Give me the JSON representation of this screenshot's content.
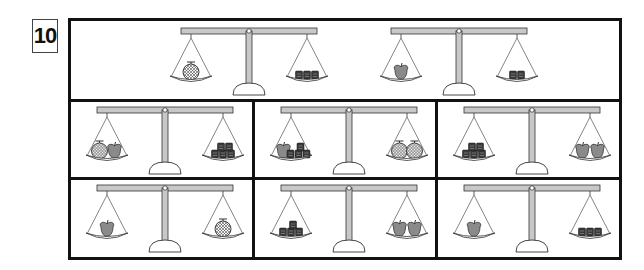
{
  "question_number": "10",
  "colors": {
    "beam": "#c8c8c8",
    "outline": "#333333",
    "apple": "#8a8a8a",
    "box": "#3a3a3a",
    "melon_fill": "#f4f4f4"
  },
  "top_row": {
    "scales": [
      {
        "left": [
          {
            "type": "melon",
            "count": 1
          }
        ],
        "right": [
          {
            "type": "box",
            "count": 3
          }
        ]
      },
      {
        "left": [
          {
            "type": "apple",
            "count": 1
          }
        ],
        "right": [
          {
            "type": "box",
            "count": 2
          }
        ]
      }
    ]
  },
  "options": [
    {
      "left": [
        {
          "type": "melon",
          "count": 1
        },
        {
          "type": "apple",
          "count": 1
        }
      ],
      "right": [
        {
          "type": "box",
          "count": 5
        }
      ]
    },
    {
      "left": [
        {
          "type": "apple",
          "count": 1
        },
        {
          "type": "box",
          "count": 4
        }
      ],
      "right": [
        {
          "type": "melon",
          "count": 2
        }
      ]
    },
    {
      "left": [
        {
          "type": "box",
          "count": 5
        }
      ],
      "right": [
        {
          "type": "apple",
          "count": 2
        }
      ]
    },
    {
      "left": [
        {
          "type": "apple",
          "count": 1
        }
      ],
      "right": [
        {
          "type": "melon",
          "count": 1
        }
      ]
    },
    {
      "left": [
        {
          "type": "box",
          "count": 4
        }
      ],
      "right": [
        {
          "type": "apple",
          "count": 2
        }
      ]
    },
    {
      "left": [
        {
          "type": "apple",
          "count": 1
        }
      ],
      "right": [
        {
          "type": "box",
          "count": 3
        }
      ]
    }
  ]
}
